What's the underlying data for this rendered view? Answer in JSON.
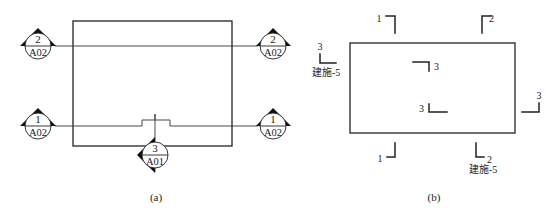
{
  "figure_a": {
    "caption": "(a)",
    "symbols": [
      {
        "id": "sym-left-top",
        "number": "2",
        "sheet": "A02"
      },
      {
        "id": "sym-left-bottom",
        "number": "1",
        "sheet": "A02"
      },
      {
        "id": "sym-right-top",
        "number": "2",
        "sheet": "A02"
      },
      {
        "id": "sym-right-bottom",
        "number": "1",
        "sheet": "A02"
      },
      {
        "id": "sym-bottom",
        "number": "3",
        "sheet": "A01"
      }
    ]
  },
  "figure_b": {
    "caption": "(b)",
    "marks": [
      {
        "id": "mark-top-1",
        "label": "1"
      },
      {
        "id": "mark-top-2",
        "label": "2"
      },
      {
        "id": "mark-left-3",
        "label": "3",
        "sheet": "建施-5"
      },
      {
        "id": "mark-inner-3a",
        "label": "3"
      },
      {
        "id": "mark-inner-3b",
        "label": "3"
      },
      {
        "id": "mark-right-3",
        "label": "3"
      },
      {
        "id": "mark-bottom-1",
        "label": "1"
      },
      {
        "id": "mark-bottom-2",
        "label": "2",
        "sheet": "建施-5"
      }
    ]
  }
}
